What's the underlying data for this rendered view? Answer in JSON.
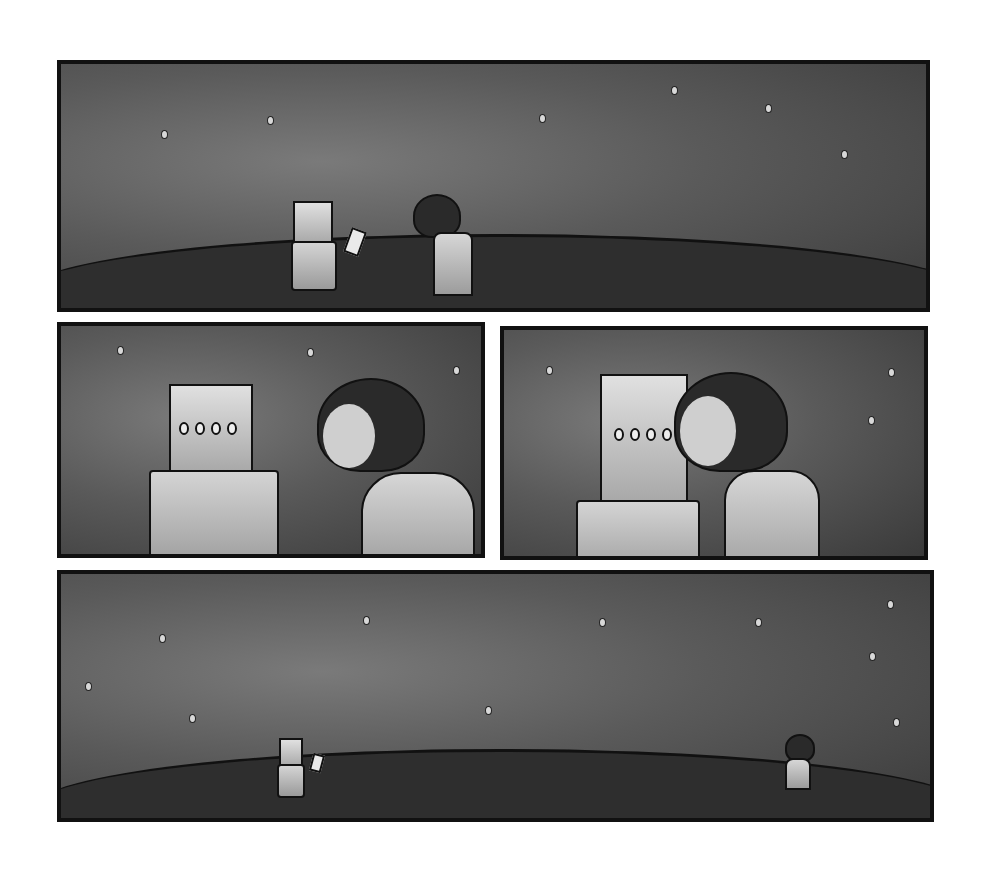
{
  "comic": {
    "panels": [
      {
        "id": "wide-meeting",
        "description": "Robot holding paper faces girl on a hill under a starry sky"
      },
      {
        "id": "closeup-facing",
        "description": "Close-up of robot and girl facing each other"
      },
      {
        "id": "closeup-kiss",
        "description": "Girl kisses the robot's face"
      },
      {
        "id": "wide-wave",
        "description": "Robot and girl far apart on the hill, girl waving"
      }
    ],
    "colors": {
      "border": "#111111",
      "sky": "#5a5a5a",
      "ground": "#2e2e2e",
      "background": "#ffffff"
    }
  }
}
